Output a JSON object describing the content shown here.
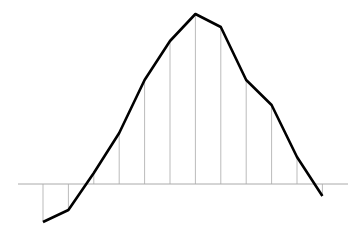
{
  "chart_data": {
    "type": "line",
    "title": "",
    "xlabel": "",
    "ylabel": "",
    "x": [
      1,
      2,
      3,
      4,
      5,
      6,
      7,
      8,
      9,
      10,
      11,
      12
    ],
    "values": [
      -38,
      -26,
      11,
      51,
      104,
      143,
      170,
      157,
      104,
      79,
      27,
      -12
    ],
    "series": [
      {
        "name": "series",
        "values": [
          -38,
          -26,
          11,
          51,
          104,
          143,
          170,
          157,
          104,
          79,
          27,
          -12
        ]
      }
    ],
    "ylim": [
      -51,
      184
    ],
    "grid": false,
    "legend": null,
    "drop_lines": true,
    "baseline": 0
  },
  "style": {
    "line_color": "#000000",
    "drop_line_color": "#bbbbbb",
    "axis_color": "#aaaaaa"
  },
  "layout": {
    "baseline_y": 184,
    "x_start": 43,
    "x_step": 25.4,
    "axis_x0": 18,
    "axis_x1": 348,
    "px_per_unit": 1
  }
}
